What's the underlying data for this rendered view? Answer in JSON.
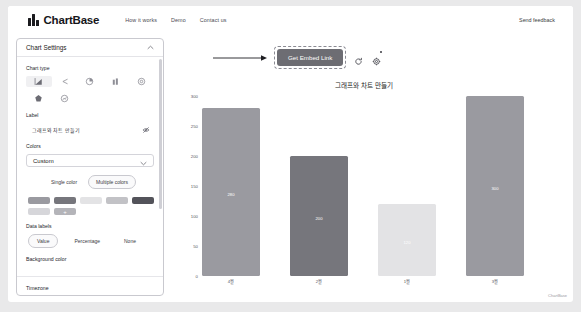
{
  "nav": {
    "brand": "ChartBase",
    "links": [
      {
        "label": "How it works"
      },
      {
        "label": "Demo"
      },
      {
        "label": "Contact us"
      }
    ],
    "feedback": "Send feedback"
  },
  "sidebar": {
    "title": "Chart Settings",
    "collapse_icon": "chevron-up-icon",
    "chart_type": {
      "label": "Chart type",
      "options": [
        {
          "name": "bar-chart-icon",
          "selected": true
        },
        {
          "name": "line-chart-icon",
          "selected": false
        },
        {
          "name": "pie-chart-icon",
          "selected": false
        },
        {
          "name": "column-chart-icon",
          "selected": false
        },
        {
          "name": "donut-chart-icon",
          "selected": false
        },
        {
          "name": "radar-chart-icon",
          "selected": false
        },
        {
          "name": "bubble-chart-icon",
          "selected": false
        }
      ]
    },
    "label_field": {
      "label": "Label",
      "value": "그래프와 차트 만들기",
      "visibility_icon": "eye-off-icon"
    },
    "colors": {
      "label": "Colors",
      "selected": "Custom",
      "chevron": "chevron-down-icon",
      "mode": {
        "single": "Single color",
        "multiple": "Multiple colors",
        "active": "Multiple colors"
      },
      "swatches": [
        "#9a9aa0",
        "#76767c",
        "#e3e3e5",
        "#c2c2c6",
        "#53535a",
        "#d6d6da",
        "#b4b4b9"
      ],
      "add_label": "+"
    },
    "data_labels": {
      "label": "Data labels",
      "options": [
        "Value",
        "Percentage",
        "None"
      ],
      "active": "Value"
    },
    "background_color": {
      "label": "Background color"
    },
    "timezone": {
      "label": "Timezone"
    }
  },
  "toolbar": {
    "embed_label": "Get Embed Link",
    "refresh_icon": "refresh-icon",
    "settings_icon": "gear-icon"
  },
  "chart_data": {
    "type": "bar",
    "title": "그래프와 차트 만들기",
    "xlabel": "",
    "ylabel": "",
    "categories": [
      "4월",
      "2월",
      "1월",
      "3월"
    ],
    "values": [
      280,
      200,
      120,
      300
    ],
    "value_labels": [
      "280",
      "200",
      "120",
      "300"
    ],
    "colors": [
      "#9a9aa0",
      "#76767c",
      "#e3e3e5",
      "#9a9aa0"
    ],
    "ylim": [
      0,
      300
    ],
    "yticks": [
      "300",
      "250",
      "200",
      "150",
      "100",
      "50",
      "0"
    ],
    "grid": false,
    "legend": "none",
    "data_labels_inside": true
  },
  "watermark": "ChartBase"
}
